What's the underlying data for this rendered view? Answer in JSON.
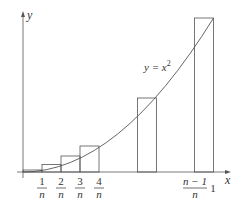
{
  "figure": {
    "axis_x_label": "x",
    "axis_y_label": "y",
    "curve_label": "y = x",
    "curve_exponent": "2",
    "tick_labels": [
      {
        "num": "1",
        "den": "n"
      },
      {
        "num": "2",
        "den": "n"
      },
      {
        "num": "3",
        "den": "n"
      },
      {
        "num": "4",
        "den": "n"
      },
      {
        "num": "n − 1",
        "den": "n"
      }
    ],
    "end_label": "1",
    "colors": {
      "line": "#555555",
      "rect": "#555555",
      "background": "#ffffff"
    }
  }
}
